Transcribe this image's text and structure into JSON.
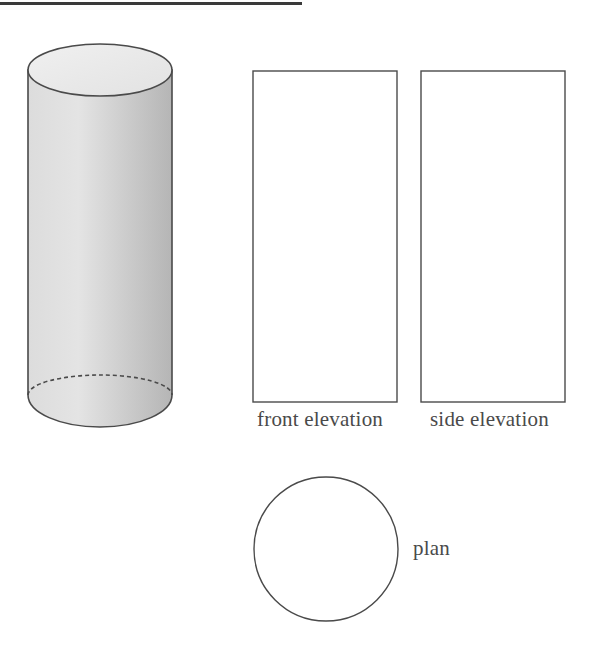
{
  "diagram": {
    "type": "orthographic-projection",
    "solid": "cylinder",
    "labels": {
      "front": "front elevation",
      "side": "side elevation",
      "plan": "plan"
    },
    "colors": {
      "stroke": "#4a4a4a",
      "cylinder_fill_light": "#ededed",
      "cylinder_fill_dark": "#b8b8b8",
      "top_rule": "#3a3a3a"
    }
  }
}
